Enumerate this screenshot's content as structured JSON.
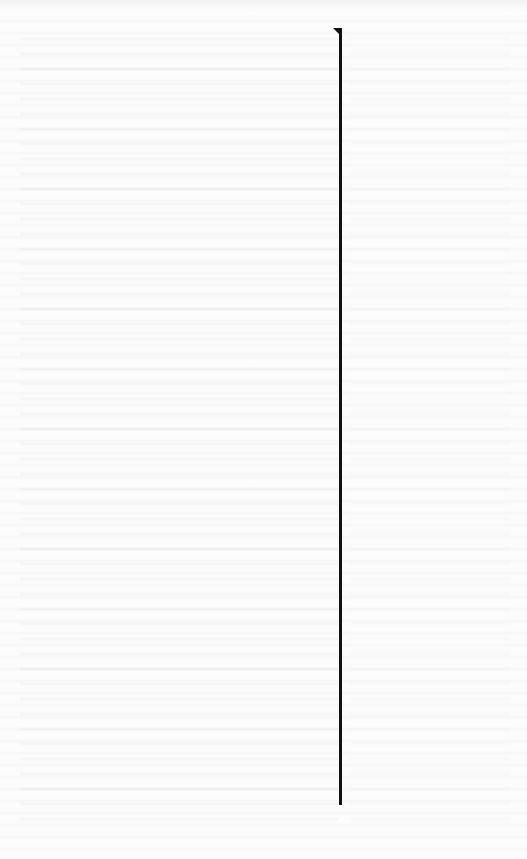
{
  "document": {
    "type": "scanned blank page",
    "visible_text": "",
    "colors": {
      "paper": "#fcfcfc",
      "rule": "#111111"
    },
    "elements": {
      "vertical_rule": {
        "x": 340,
        "top": 30,
        "bottom": 805
      },
      "top_notch": {
        "x": 333,
        "y": 28
      }
    }
  }
}
